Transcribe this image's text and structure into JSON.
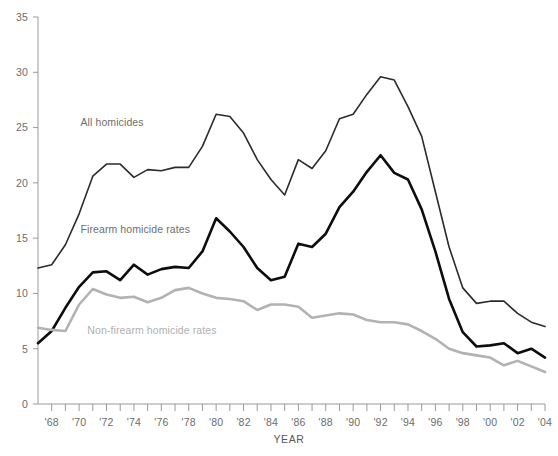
{
  "chart_data": {
    "type": "line",
    "title": "",
    "xlabel": "YEAR",
    "ylabel": "",
    "xlim": [
      1967,
      2004
    ],
    "ylim": [
      0,
      35
    ],
    "ytick_step": 5,
    "grid": false,
    "legend": "inline-labels",
    "x": [
      1967,
      1968,
      1969,
      1970,
      1971,
      1972,
      1973,
      1974,
      1975,
      1976,
      1977,
      1978,
      1979,
      1980,
      1981,
      1982,
      1983,
      1984,
      1985,
      1986,
      1987,
      1988,
      1989,
      1990,
      1991,
      1992,
      1993,
      1994,
      1995,
      1996,
      1997,
      1998,
      1999,
      2000,
      2001,
      2002,
      2003,
      2004
    ],
    "yticks": [
      0,
      5,
      10,
      15,
      20,
      25,
      30,
      35
    ],
    "xticklabels": [
      "'68",
      "'70",
      "'72",
      "'74",
      "'76",
      "'78",
      "'80",
      "'82",
      "'84",
      "'86",
      "'88",
      "'90",
      "'92",
      "'94",
      "'96",
      "'98",
      "'00",
      "'02",
      "'04"
    ],
    "xticklabel_years": [
      1968,
      1970,
      1972,
      1974,
      1976,
      1978,
      1980,
      1982,
      1984,
      1986,
      1988,
      1990,
      1992,
      1994,
      1996,
      1998,
      2000,
      2002,
      2004
    ],
    "series": [
      {
        "name": "All homicides",
        "color": "#2b2b2b",
        "width": 1.6,
        "label_x": 1970.1,
        "label_y": 25.1,
        "values": [
          12.3,
          12.6,
          14.4,
          17.2,
          20.6,
          21.7,
          21.7,
          20.5,
          21.2,
          21.1,
          21.4,
          21.4,
          23.3,
          26.2,
          26.0,
          24.5,
          22.1,
          20.3,
          18.9,
          22.1,
          21.3,
          22.9,
          25.8,
          26.2,
          28.0,
          29.6,
          29.3,
          26.9,
          24.2,
          19.2,
          14.2,
          10.5,
          9.1,
          9.3,
          9.3,
          8.2,
          7.4,
          7.0
        ]
      },
      {
        "name": "Firearm homicide rates",
        "color": "#0d0d0d",
        "width": 2.6,
        "label_x": 1970.1,
        "label_y": 15.5,
        "values": [
          5.5,
          6.6,
          8.7,
          10.6,
          11.9,
          12.0,
          11.2,
          12.6,
          11.7,
          12.2,
          12.4,
          12.3,
          13.8,
          16.8,
          15.6,
          14.2,
          12.3,
          11.2,
          11.5,
          14.5,
          14.2,
          15.4,
          17.8,
          19.2,
          21.0,
          22.5,
          20.9,
          20.3,
          17.6,
          13.8,
          9.5,
          6.5,
          5.2,
          5.3,
          5.5,
          4.6,
          5.0,
          4.2
        ]
      },
      {
        "name": "Non-firearm homicide rates",
        "color": "#b2b2b2",
        "width": 2.6,
        "label_x": 1970.6,
        "label_y": 6.3,
        "values": [
          6.9,
          6.7,
          6.6,
          9.0,
          10.4,
          9.9,
          9.6,
          9.7,
          9.2,
          9.6,
          10.3,
          10.5,
          10.0,
          9.6,
          9.5,
          9.3,
          8.5,
          9.0,
          9.0,
          8.8,
          7.8,
          8.0,
          8.2,
          8.1,
          7.6,
          7.4,
          7.4,
          7.2,
          6.6,
          5.9,
          5.0,
          4.6,
          4.4,
          4.2,
          3.5,
          3.9,
          3.4,
          2.9
        ]
      }
    ]
  }
}
